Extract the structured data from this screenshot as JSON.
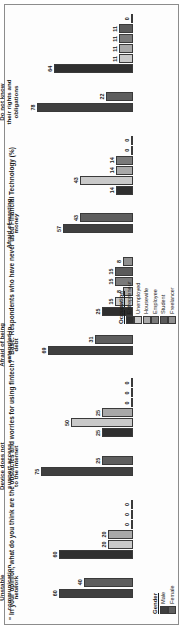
{
  "figure": {
    "title": "\" In your opinion, what do you think are the obstacles and worries for using fintech?\"  Base: Respondents who have never used Financial Technology (%)"
  },
  "legends": {
    "gender": {
      "title": "Gender",
      "items": [
        {
          "label": "Male",
          "color": "#3f3f3f"
        },
        {
          "label": "Female",
          "color": "#5e5e5e"
        }
      ]
    },
    "occupation": {
      "title": "Occupation",
      "items": [
        {
          "label": "Entrepreneur",
          "color": "#2f2f2f"
        },
        {
          "label": "Unemployed",
          "color": "#c9c9c9"
        },
        {
          "label": "Housewife",
          "color": "#a8a8a8"
        },
        {
          "label": "Employee",
          "color": "#7a7a7a"
        },
        {
          "label": "Student",
          "color": "#5a5a5a"
        },
        {
          "label": "Freelancer",
          "color": "#8f8f8f"
        }
      ]
    }
  },
  "chart_data": {
    "type": "bar",
    "title": "\" In your opinion, what do you think are the obstacles and worries for using fintech?\"  Base: Respondents who have never used Financial Technology (%)",
    "xlabel": "",
    "ylabel": "%",
    "ylim": [
      0,
      80
    ],
    "grid": false,
    "legend_position": "bottom",
    "panels": [
      {
        "name": "gender",
        "legend": [
          "Male",
          "Female"
        ],
        "categories": [
          "Unstable communication network",
          "Device does not support access to the internet",
          "Afraid of being entangled in debt",
          "Afraid of wasting money",
          "Do not know their rights and obligations"
        ],
        "series": [
          {
            "name": "Male",
            "values": [
              60,
              75,
              69,
              57,
              78
            ]
          },
          {
            "name": "Female",
            "values": [
              40,
              25,
              31,
              43,
              22
            ]
          }
        ]
      },
      {
        "name": "occupation",
        "legend": [
          "Entrepreneur",
          "Unemployed",
          "Housewife",
          "Employee",
          "Student",
          "Freelancer"
        ],
        "categories": [
          "Unstable communication network",
          "Device does not support access to the internet",
          "Afraid of being entangled in debt",
          "Afraid of wasting money",
          "Do not know their rights and obligations"
        ],
        "series": [
          {
            "name": "Entrepreneur",
            "values": [
              60,
              25,
              25,
              14,
              64
            ]
          },
          {
            "name": "Unemployed",
            "values": [
              20,
              50,
              15,
              43,
              11
            ]
          },
          {
            "name": "Housewife",
            "values": [
              20,
              25,
              8,
              14,
              11
            ]
          },
          {
            "name": "Employee",
            "values": [
              0,
              0,
              15,
              14,
              11
            ]
          },
          {
            "name": "Student",
            "values": [
              0,
              0,
              15,
              0,
              11
            ]
          },
          {
            "name": "Freelancer",
            "values": [
              0,
              0,
              8,
              0,
              0
            ]
          }
        ]
      }
    ]
  }
}
